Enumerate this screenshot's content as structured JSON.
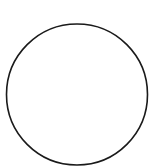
{
  "diagram": {
    "shape": "circle",
    "center": {
      "x": 77,
      "y": 94.5
    },
    "radius": 70.5,
    "stroke_color": "#1a1a1a",
    "stroke_width": 1.6,
    "fill_color": "#ffffff",
    "background_color": "#ffffff"
  }
}
